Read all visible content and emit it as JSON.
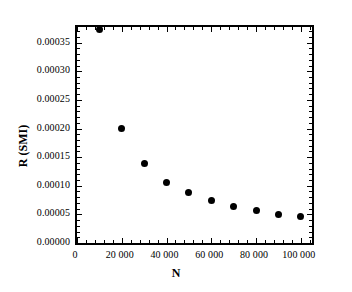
{
  "chart_data": {
    "type": "scatter",
    "title": "",
    "xlabel": "N",
    "ylabel": "R (SMI)",
    "xlim": [
      0,
      105000
    ],
    "ylim": [
      0,
      0.0003773
    ],
    "grid": false,
    "legend": null,
    "marker": "filled-circle",
    "marker_color": "#000000",
    "x": [
      10000,
      20000,
      30000,
      40000,
      50000,
      60000,
      70000,
      80000,
      90000,
      100000
    ],
    "values": [
      0.000373,
      0.0002,
      0.000138,
      0.000106,
      8.75e-05,
      7.35e-05,
      6.35e-05,
      5.65e-05,
      5.05e-05,
      4.65e-05
    ],
    "x_ticks": [
      0,
      20000,
      40000,
      60000,
      80000,
      100000
    ],
    "x_tick_labels": [
      "0",
      "20 000",
      "40 000",
      "60 000",
      "80 000",
      "100 000"
    ],
    "y_ticks": [
      0,
      5e-05,
      0.0001,
      0.00015,
      0.0002,
      0.00025,
      0.0003,
      0.00035
    ],
    "y_tick_labels": [
      "0.00000",
      "0.00005",
      "0.00010",
      "0.00015",
      "0.00020",
      "0.00025",
      "0.00030",
      "0.00035"
    ],
    "x_minor_count": 4,
    "y_minor_count": 4
  },
  "colors": {
    "background": "#ffffff",
    "axis": "#000000",
    "marker": "#000000",
    "text": "#000000"
  }
}
